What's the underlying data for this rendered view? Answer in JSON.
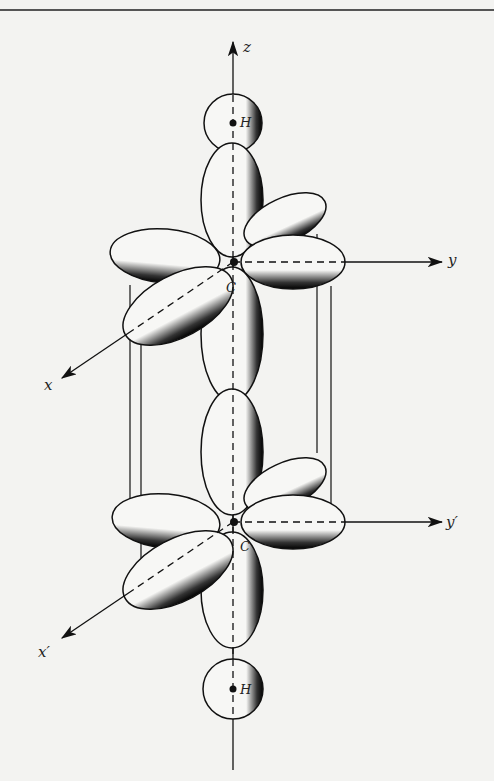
{
  "figure": {
    "axes": {
      "z": "z",
      "y": "y",
      "x": "x",
      "y_prime": "y′",
      "x_prime": "x′"
    },
    "atoms": {
      "h_top": "H",
      "c_top": "C",
      "c_bottom": "C",
      "h_bottom": "H"
    }
  },
  "colors": {
    "background": "#f3f3f1",
    "ink": "#111111",
    "lobe_fill": "#f7f7f5"
  }
}
